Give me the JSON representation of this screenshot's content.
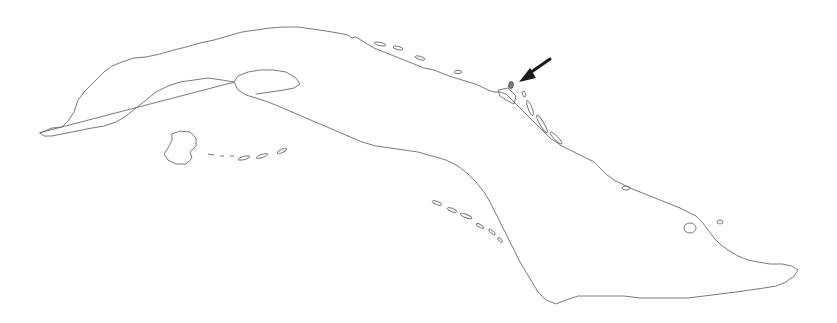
{
  "map": {
    "subject": "Cuba outline",
    "marker": {
      "type": "arrow",
      "color": "#1a1a1a",
      "points_to": "small cay off the north coast"
    },
    "outline_color": "#6b6b6b",
    "background": "#ffffff"
  }
}
